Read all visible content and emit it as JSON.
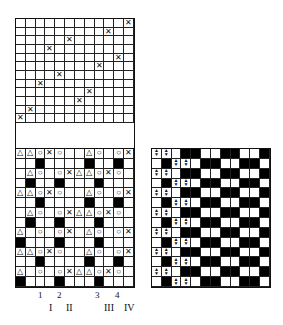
{
  "diagram": {
    "type": "weave-draft",
    "threading": {
      "cols": 12,
      "rows": 12,
      "marks": [
        [
          1,
          12
        ],
        [
          2,
          10
        ],
        [
          3,
          6
        ],
        [
          4,
          4
        ],
        [
          5,
          11
        ],
        [
          6,
          9
        ],
        [
          7,
          5
        ],
        [
          8,
          3
        ],
        [
          9,
          8
        ],
        [
          10,
          7
        ],
        [
          11,
          2
        ],
        [
          12,
          1
        ]
      ],
      "mark_symbol": "✕"
    },
    "left_grid": {
      "cols": 12,
      "rows": [
        [
          "t",
          "t",
          "o",
          "x",
          "o",
          "",
          "",
          "t",
          "o",
          "",
          "o",
          "x"
        ],
        [
          "",
          "",
          "b",
          "",
          "",
          "",
          "",
          "b",
          "",
          "",
          "b",
          ""
        ],
        [
          "",
          "t",
          "o",
          "",
          "o",
          "x",
          "t",
          "t",
          "o",
          "x",
          "o",
          ""
        ],
        [
          "",
          "b",
          "",
          "",
          "b",
          "",
          "",
          "",
          "b",
          "",
          "",
          ""
        ],
        [
          "t",
          "t",
          "o",
          "x",
          "o",
          "",
          "",
          "t",
          "o",
          "",
          "o",
          "x"
        ],
        [
          "",
          "",
          "b",
          "",
          "",
          "",
          "",
          "b",
          "",
          "",
          "b",
          ""
        ],
        [
          "",
          "t",
          "o",
          "",
          "o",
          "x",
          "t",
          "t",
          "o",
          "x",
          "o",
          ""
        ],
        [
          "",
          "b",
          "",
          "",
          "b",
          "",
          "",
          "",
          "b",
          "",
          "",
          ""
        ],
        [
          "t",
          "",
          "o",
          "",
          "o",
          "x",
          "",
          "t",
          "o",
          "",
          "o",
          "x"
        ],
        [
          "b",
          "",
          "",
          "",
          "b",
          "",
          "",
          "",
          "b",
          "",
          "",
          ""
        ],
        [
          "t",
          "t",
          "o",
          "x",
          "o",
          "",
          "",
          "t",
          "o",
          "",
          "o",
          "x"
        ],
        [
          "",
          "",
          "b",
          "",
          "",
          "",
          "",
          "b",
          "",
          "",
          "b",
          ""
        ],
        [
          "t",
          "",
          "o",
          "",
          "o",
          "x",
          "t",
          "t",
          "o",
          "x",
          "o",
          ""
        ],
        [
          "b",
          "",
          "",
          "",
          "b",
          "",
          "",
          "",
          "b",
          "",
          "",
          ""
        ]
      ],
      "symbols": {
        "t": "△",
        "o": "○",
        "x": "✕",
        "b": "■"
      }
    },
    "right_grid": {
      "cols": 12,
      "row_types": {
        "A": [
          "a",
          "a",
          "",
          "b",
          "b",
          "",
          "",
          "b",
          "b",
          "",
          "",
          "b"
        ],
        "B": [
          "",
          "b",
          "a",
          "a",
          "",
          "b",
          "b",
          "",
          "",
          "b",
          "b",
          ""
        ]
      },
      "rows": [
        "A",
        "B",
        "A",
        "B",
        "A",
        "B",
        "A",
        "B",
        "A",
        "B",
        "A",
        "B",
        "A",
        "B"
      ],
      "arrow_symbol_up": "▲",
      "arrow_symbol_down": "▼"
    },
    "column_numbers": [
      "1",
      "2",
      "3",
      "4"
    ],
    "roman_labels": [
      "I",
      "II",
      "III",
      "IV"
    ]
  }
}
